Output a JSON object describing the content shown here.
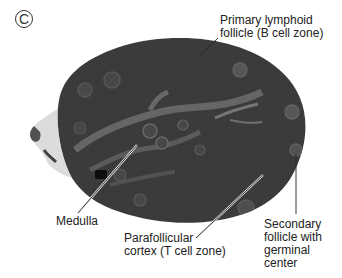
{
  "figure": {
    "panel_letter": "C",
    "labels": {
      "primary_follicle": "Primary lymphoid\nfollicle (B cell zone)",
      "medulla": "Medulla",
      "parafollicular": "Parafollicular\ncortex (T cell zone)",
      "secondary_follicle": "Secondary\nfollicle with\ngerminal\ncenter"
    },
    "colors": {
      "tissue_dark": "#3a3a3a",
      "tissue_mid": "#555555",
      "medulla_light": "#8a8a8a",
      "background": "#ffffff",
      "leader_line": "#222222"
    }
  }
}
